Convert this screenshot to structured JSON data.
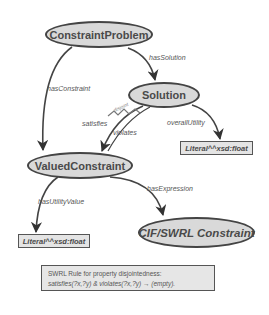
{
  "nodes": {
    "constraint_problem": "ConstraintProblem",
    "solution": "Solution",
    "valued_constraint": "ValuedConstraint",
    "cif_swrl": "CIF/SWRL Constraint",
    "literal_overall": "Literal^^xsd:float",
    "literal_utility": "Literal^^xsd:float"
  },
  "edges": {
    "has_solution": "hasSolution",
    "has_constraint": "hasConstraint",
    "satisfies": "satisfies",
    "violates": "violates",
    "disjoint": "disjoint",
    "overall_utility": "overallUtility",
    "has_utility_value": "hasUtilityValue",
    "has_expression": "hasExpression"
  },
  "rule": {
    "title": "SWRL Rule for property disjointedness:",
    "expression": "satisfies(?x,?y) & violates(?x,?y) → (empty)."
  },
  "colors": {
    "node_fill": "#d9d9d9",
    "stroke": "#444444",
    "text": "#4a4a4a"
  }
}
